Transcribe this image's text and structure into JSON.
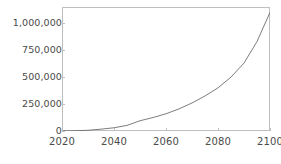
{
  "chart_data": {
    "type": "line",
    "title": "",
    "subtitle": "",
    "xlabel": "",
    "ylabel": "",
    "xlim": [
      2020,
      2100
    ],
    "ylim": [
      0,
      1150000
    ],
    "grid": false,
    "legend": null,
    "x_ticks": [
      2020,
      2040,
      2060,
      2080,
      2100
    ],
    "x_tick_labels": [
      "2020",
      "2040",
      "2060",
      "2080",
      "2100"
    ],
    "y_ticks": [
      0,
      250000,
      500000,
      750000,
      1000000
    ],
    "y_tick_labels": [
      "0",
      "250,000",
      "500,000",
      "750,000",
      "1,000,000"
    ],
    "line_color": "#6e6e6e",
    "frame_color": "#bfbfbf",
    "tick_label_color": "#4a4a4a",
    "series": [
      {
        "name": "",
        "x": [
          2020,
          2025,
          2030,
          2035,
          2040,
          2045,
          2050,
          2055,
          2060,
          2065,
          2070,
          2075,
          2080,
          2085,
          2090,
          2095,
          2100
        ],
        "y": [
          1000,
          2600,
          6700,
          17000,
          30000,
          52000,
          95000,
          125000,
          160000,
          205000,
          260000,
          325000,
          400000,
          500000,
          630000,
          830000,
          1100000
        ]
      }
    ]
  }
}
